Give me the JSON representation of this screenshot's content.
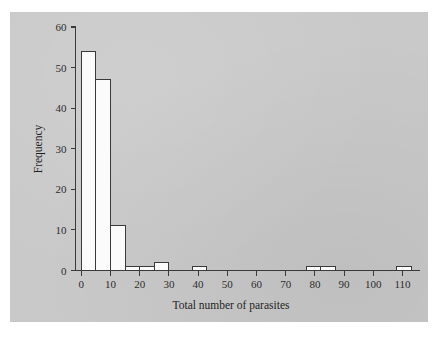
{
  "figure": {
    "background_color": "#ffffff",
    "panel_color": "#c9c9c9",
    "bar_fill_color": "#fbfbfb",
    "bar_stroke_color": "#3a3a3a",
    "axis_color": "#3a3a3a"
  },
  "chart_data": {
    "type": "bar",
    "title": "",
    "subtitle": "",
    "xlabel": "Total number of parasites",
    "ylabel": "Frequency",
    "xlim": [
      -2,
      116
    ],
    "ylim": [
      0,
      60
    ],
    "grid": false,
    "legend": null,
    "legend_position": "none",
    "xticks": [
      0,
      10,
      20,
      30,
      40,
      50,
      60,
      70,
      80,
      90,
      100,
      110
    ],
    "xticklabels": [
      "0",
      "10",
      "20",
      "30",
      "40",
      "50",
      "60",
      "70",
      "80",
      "90",
      "100",
      "110"
    ],
    "yticks": [
      0,
      10,
      20,
      30,
      40,
      50,
      60
    ],
    "yticklabels": [
      "0",
      "10",
      "20",
      "30",
      "40",
      "50",
      "60"
    ],
    "bin_width": 5,
    "bins": [
      {
        "left": 0,
        "right": 5,
        "value": 54
      },
      {
        "left": 5,
        "right": 10,
        "value": 47
      },
      {
        "left": 10,
        "right": 15,
        "value": 11
      },
      {
        "left": 15,
        "right": 20,
        "value": 1
      },
      {
        "left": 20,
        "right": 25,
        "value": 1
      },
      {
        "left": 25,
        "right": 30,
        "value": 2
      },
      {
        "left": 38,
        "right": 43,
        "value": 1
      },
      {
        "left": 77,
        "right": 82,
        "value": 1
      },
      {
        "left": 82,
        "right": 87,
        "value": 1
      },
      {
        "left": 108,
        "right": 113,
        "value": 1
      }
    ],
    "categories": [
      "0-5",
      "5-10",
      "10-15",
      "15-20",
      "20-25",
      "25-30",
      "38-43",
      "77-82",
      "82-87",
      "108-113"
    ],
    "values": [
      54,
      47,
      11,
      1,
      1,
      2,
      1,
      1,
      1,
      1
    ]
  }
}
